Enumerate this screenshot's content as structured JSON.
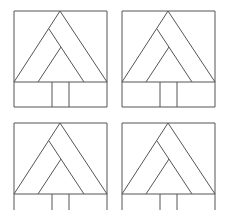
{
  "diagram": {
    "stroke_color": "#555555",
    "background": "#ffffff",
    "panels": [
      {
        "id": "top-left",
        "x": 0,
        "y": 0
      },
      {
        "id": "top-right",
        "x": 108,
        "y": 0
      },
      {
        "id": "bottom-left",
        "x": 0,
        "y": 112
      },
      {
        "id": "bottom-right",
        "x": 108,
        "y": 112
      }
    ],
    "figure": {
      "frame": {
        "left": 14,
        "top": 11,
        "right": 107,
        "base": 82,
        "bottom": 107
      },
      "outer_triangle": {
        "apex": [
          60,
          11
        ],
        "base_left": [
          14,
          82
        ],
        "base_right": [
          107,
          82
        ]
      },
      "inner_line_1": {
        "from": [
          49,
          29
        ],
        "to": [
          84,
          82
        ]
      },
      "inner_line_2": {
        "from": [
          61,
          47
        ],
        "to": [
          38,
          82
        ]
      },
      "trunk_lines_x": [
        52,
        69
      ]
    }
  }
}
